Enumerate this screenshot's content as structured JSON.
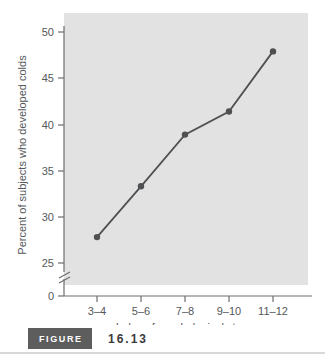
{
  "chart_data": {
    "type": "line",
    "title": "",
    "xlabel": "Index of psychological stress",
    "ylabel": "Percent of subjects who developed colds",
    "categories": [
      "3–4",
      "5–6",
      "7–8",
      "9–10",
      "11–12"
    ],
    "values": [
      27.8,
      33.3,
      38.9,
      41.4,
      47.9
    ],
    "series": [
      {
        "name": "Percent who developed colds",
        "values": [
          27.8,
          33.3,
          38.9,
          41.4,
          47.9
        ]
      }
    ],
    "ytick_labels": [
      "0",
      "25",
      "30",
      "35",
      "40",
      "45",
      "50"
    ],
    "ytick_values": [
      0,
      25,
      30,
      35,
      40,
      45,
      50
    ],
    "ylim": [
      25,
      51
    ],
    "axis_break": true,
    "axis_break_note": "y-axis broken between 0 and 25",
    "grid": false,
    "legend": "none",
    "marker": "filled-circle",
    "plot_background": "#e2e2e2",
    "line_color": "#4f5052",
    "marker_color": "#4f5052",
    "axis_color": "#6c6e70",
    "text_color": "#55585a"
  },
  "caption": {
    "badge_label": "FIGURE",
    "number": "16.13",
    "badge_background": "#5d5d5d",
    "badge_text_color": "#ffffff",
    "number_color": "#3b3b3b"
  }
}
